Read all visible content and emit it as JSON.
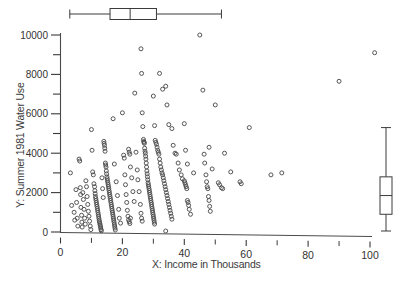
{
  "figure": {
    "kind": "scatterplot-with-marginal-boxplots",
    "background_color": "#ffffff",
    "ink_color": "#3a3a3a",
    "marker": "open-circle"
  },
  "axes": {
    "x_axis_label": "X:    Income in Thousands",
    "y_axis_label": "Y:    Summer 1981 Water Use",
    "x_major_ticks": [
      0,
      20,
      40,
      60,
      80,
      100
    ],
    "x_minor_ticks": [
      10,
      30,
      50,
      70,
      90
    ],
    "y_major_ticks": [
      0,
      2000,
      4000,
      6000,
      8000,
      10000
    ],
    "y_minor_ticks": [
      1000,
      3000,
      5000,
      7000,
      9000
    ],
    "x_major_tick_labels": [
      "0",
      "20",
      "40",
      "60",
      "80",
      "100"
    ],
    "y_major_tick_labels": [
      "0",
      "2000",
      "4000",
      "6000",
      "8000",
      "10000"
    ],
    "xlim": [
      -1,
      107
    ],
    "ylim": [
      -200,
      10300
    ]
  },
  "chart_data": {
    "type": "scatter",
    "title": "",
    "xlabel": "X:    Income in Thousands",
    "ylabel": "Y:    Summer 1981 Water Use",
    "xlim": [
      -1,
      107
    ],
    "ylim": [
      -200,
      10300
    ],
    "grid": false,
    "legend": null,
    "marker_style": "open circle",
    "x_tick_labels": [
      "0",
      "20",
      "40",
      "60",
      "80",
      "100"
    ],
    "y_tick_labels": [
      "0",
      "2000",
      "4000",
      "6000",
      "8000",
      "10000"
    ],
    "points": [
      [
        3.2,
        3000
      ],
      [
        3.6,
        1350
      ],
      [
        4.4,
        1000
      ],
      [
        4.6,
        600
      ],
      [
        5.0,
        2150
      ],
      [
        5.2,
        1500
      ],
      [
        5.4,
        700
      ],
      [
        5.6,
        300
      ],
      [
        6.0,
        3700
      ],
      [
        6.2,
        3600
      ],
      [
        6.4,
        2250
      ],
      [
        6.5,
        1900
      ],
      [
        6.6,
        1250
      ],
      [
        6.8,
        850
      ],
      [
        6.9,
        500
      ],
      [
        7.0,
        250
      ],
      [
        7.2,
        2000
      ],
      [
        7.4,
        1650
      ],
      [
        7.6,
        1150
      ],
      [
        7.8,
        700
      ],
      [
        8.0,
        400
      ],
      [
        8.2,
        2600
      ],
      [
        8.4,
        2300
      ],
      [
        8.6,
        1800
      ],
      [
        8.8,
        1400
      ],
      [
        9.0,
        1050
      ],
      [
        9.2,
        800
      ],
      [
        9.4,
        550
      ],
      [
        9.6,
        300
      ],
      [
        9.8,
        120
      ],
      [
        10.0,
        5200
      ],
      [
        10.2,
        4150
      ],
      [
        10.4,
        3050
      ],
      [
        10.6,
        2900
      ],
      [
        10.8,
        2450
      ],
      [
        11.0,
        2300
      ],
      [
        11.1,
        2100
      ],
      [
        11.2,
        1950
      ],
      [
        11.3,
        1800
      ],
      [
        11.4,
        1700
      ],
      [
        11.5,
        1600
      ],
      [
        11.6,
        1500
      ],
      [
        11.7,
        1400
      ],
      [
        11.8,
        1300
      ],
      [
        11.9,
        1200
      ],
      [
        12.0,
        1100
      ],
      [
        12.1,
        1000
      ],
      [
        12.2,
        900
      ],
      [
        12.3,
        800
      ],
      [
        12.4,
        700
      ],
      [
        12.5,
        600
      ],
      [
        12.6,
        520
      ],
      [
        12.7,
        440
      ],
      [
        12.8,
        360
      ],
      [
        12.9,
        280
      ],
      [
        13.0,
        200
      ],
      [
        13.1,
        120
      ],
      [
        13.2,
        60
      ],
      [
        13.4,
        2750
      ],
      [
        13.6,
        2200
      ],
      [
        13.8,
        1750
      ],
      [
        14.0,
        4600
      ],
      [
        14.1,
        4500
      ],
      [
        14.2,
        4400
      ],
      [
        14.3,
        4250
      ],
      [
        14.4,
        4100
      ],
      [
        14.5,
        3500
      ],
      [
        14.6,
        3400
      ],
      [
        14.7,
        3300
      ],
      [
        14.8,
        3100
      ],
      [
        14.9,
        2950
      ],
      [
        15.0,
        2800
      ],
      [
        15.1,
        2700
      ],
      [
        15.2,
        2600
      ],
      [
        15.3,
        2500
      ],
      [
        15.4,
        2400
      ],
      [
        15.5,
        2300
      ],
      [
        15.6,
        2200
      ],
      [
        15.7,
        2100
      ],
      [
        15.8,
        2000
      ],
      [
        15.9,
        1900
      ],
      [
        16.0,
        1800
      ],
      [
        16.1,
        1700
      ],
      [
        16.2,
        1600
      ],
      [
        16.3,
        1500
      ],
      [
        16.4,
        1400
      ],
      [
        16.5,
        1300
      ],
      [
        16.6,
        1200
      ],
      [
        16.7,
        1100
      ],
      [
        16.8,
        1000
      ],
      [
        16.9,
        900
      ],
      [
        17.0,
        800
      ],
      [
        17.1,
        700
      ],
      [
        17.2,
        600
      ],
      [
        17.3,
        500
      ],
      [
        17.4,
        400
      ],
      [
        17.5,
        300
      ],
      [
        17.6,
        200
      ],
      [
        17.7,
        100
      ],
      [
        17.0,
        5750
      ],
      [
        17.4,
        3450
      ],
      [
        18.0,
        2550
      ],
      [
        18.4,
        1850
      ],
      [
        18.8,
        1150
      ],
      [
        19.0,
        700
      ],
      [
        19.4,
        450
      ],
      [
        20.0,
        6050
      ],
      [
        20.4,
        3900
      ],
      [
        20.6,
        3750
      ],
      [
        20.8,
        2900
      ],
      [
        21.0,
        2400
      ],
      [
        21.2,
        1900
      ],
      [
        21.4,
        1500
      ],
      [
        21.6,
        1100
      ],
      [
        21.8,
        800
      ],
      [
        22.0,
        620
      ],
      [
        22.2,
        520
      ],
      [
        22.4,
        430
      ],
      [
        22.6,
        700
      ],
      [
        22.0,
        4200
      ],
      [
        22.2,
        4050
      ],
      [
        22.4,
        3950
      ],
      [
        22.6,
        3300
      ],
      [
        23.0,
        2750
      ],
      [
        23.4,
        2050
      ],
      [
        23.8,
        1550
      ],
      [
        24.0,
        7050
      ],
      [
        24.4,
        4050
      ],
      [
        24.8,
        3150
      ],
      [
        25.0,
        2650
      ],
      [
        25.4,
        2050
      ],
      [
        25.8,
        1400
      ],
      [
        26.0,
        950
      ],
      [
        26.2,
        700
      ],
      [
        26.4,
        550
      ],
      [
        26.0,
        9300
      ],
      [
        26.2,
        8050
      ],
      [
        26.4,
        6050
      ],
      [
        26.6,
        5350
      ],
      [
        26.8,
        4700
      ],
      [
        26.9,
        4600
      ],
      [
        27.0,
        4550
      ],
      [
        27.1,
        4500
      ],
      [
        27.2,
        4250
      ],
      [
        27.3,
        4100
      ],
      [
        27.4,
        4000
      ],
      [
        27.5,
        3850
      ],
      [
        27.6,
        3700
      ],
      [
        27.7,
        3500
      ],
      [
        27.8,
        3300
      ],
      [
        27.9,
        3100
      ],
      [
        28.0,
        2950
      ],
      [
        28.1,
        2800
      ],
      [
        28.2,
        2650
      ],
      [
        28.3,
        2500
      ],
      [
        28.4,
        2400
      ],
      [
        28.5,
        2300
      ],
      [
        28.6,
        2200
      ],
      [
        28.7,
        2100
      ],
      [
        28.8,
        2000
      ],
      [
        28.9,
        1900
      ],
      [
        29.0,
        1800
      ],
      [
        29.1,
        1700
      ],
      [
        29.2,
        1600
      ],
      [
        29.3,
        1500
      ],
      [
        29.4,
        1400
      ],
      [
        29.5,
        1300
      ],
      [
        29.6,
        1200
      ],
      [
        29.7,
        1100
      ],
      [
        29.8,
        1000
      ],
      [
        29.9,
        900
      ],
      [
        30.0,
        800
      ],
      [
        30.1,
        700
      ],
      [
        30.2,
        600
      ],
      [
        30.3,
        500
      ],
      [
        30.4,
        400
      ],
      [
        30.0,
        6900
      ],
      [
        30.4,
        5400
      ],
      [
        30.6,
        4650
      ],
      [
        30.8,
        4550
      ],
      [
        31.0,
        4450
      ],
      [
        31.2,
        4300
      ],
      [
        31.4,
        4150
      ],
      [
        31.6,
        4050
      ],
      [
        31.8,
        3950
      ],
      [
        32.0,
        3700
      ],
      [
        32.2,
        3500
      ],
      [
        32.4,
        3300
      ],
      [
        32.6,
        3150
      ],
      [
        32.8,
        3000
      ],
      [
        33.0,
        2900
      ],
      [
        33.2,
        2750
      ],
      [
        33.4,
        2600
      ],
      [
        33.6,
        2450
      ],
      [
        33.8,
        2300
      ],
      [
        34.0,
        2150
      ],
      [
        34.2,
        2000
      ],
      [
        34.4,
        1850
      ],
      [
        34.6,
        1700
      ],
      [
        34.8,
        1550
      ],
      [
        35.0,
        1400
      ],
      [
        35.2,
        1250
      ],
      [
        35.4,
        1100
      ],
      [
        35.6,
        950
      ],
      [
        35.8,
        800
      ],
      [
        36.0,
        650
      ],
      [
        34.0,
        50
      ],
      [
        32.0,
        8050
      ],
      [
        33.0,
        7250
      ],
      [
        34.0,
        7400
      ],
      [
        34.4,
        6450
      ],
      [
        35.0,
        5450
      ],
      [
        36.0,
        5250
      ],
      [
        36.4,
        4400
      ],
      [
        37.0,
        4000
      ],
      [
        37.4,
        3950
      ],
      [
        38.0,
        3500
      ],
      [
        38.4,
        3150
      ],
      [
        39.0,
        2900
      ],
      [
        39.4,
        2700
      ],
      [
        40.0,
        2600
      ],
      [
        40.2,
        2500
      ],
      [
        40.4,
        2400
      ],
      [
        40.6,
        2300
      ],
      [
        40.8,
        2200
      ],
      [
        41.0,
        1600
      ],
      [
        41.2,
        1500
      ],
      [
        41.4,
        1350
      ],
      [
        41.6,
        1150
      ],
      [
        42.0,
        900
      ],
      [
        40.0,
        5500
      ],
      [
        40.4,
        4150
      ],
      [
        41.0,
        3450
      ],
      [
        43.0,
        3000
      ],
      [
        45.0,
        10000
      ],
      [
        46.0,
        7200
      ],
      [
        46.4,
        3950
      ],
      [
        46.6,
        3500
      ],
      [
        47.0,
        2900
      ],
      [
        47.2,
        2550
      ],
      [
        47.4,
        2300
      ],
      [
        47.6,
        2200
      ],
      [
        47.8,
        1800
      ],
      [
        48.0,
        1600
      ],
      [
        48.2,
        1300
      ],
      [
        48.4,
        1050
      ],
      [
        48.0,
        4300
      ],
      [
        49.0,
        3200
      ],
      [
        50.0,
        6450
      ],
      [
        51.0,
        2500
      ],
      [
        51.4,
        2400
      ],
      [
        52.0,
        2250
      ],
      [
        52.4,
        2200
      ],
      [
        53.0,
        4000
      ],
      [
        55.0,
        3050
      ],
      [
        58.0,
        2550
      ],
      [
        58.4,
        2450
      ],
      [
        61.0,
        5300
      ],
      [
        68.0,
        2900
      ],
      [
        71.5,
        3000
      ],
      [
        90.0,
        7650
      ],
      [
        101.5,
        9100
      ]
    ],
    "x_boxplot": {
      "orientation": "horizontal",
      "position": "top-margin",
      "min_whisker": 3.0,
      "q1": 16.0,
      "median": 22.5,
      "q3": 31.0,
      "max_whisker": 52.0
    },
    "y_boxplot": {
      "orientation": "vertical",
      "position": "right-margin",
      "min_whisker": 50,
      "q1": 900,
      "median": 1850,
      "q3": 2800,
      "max_whisker": 5300
    }
  }
}
